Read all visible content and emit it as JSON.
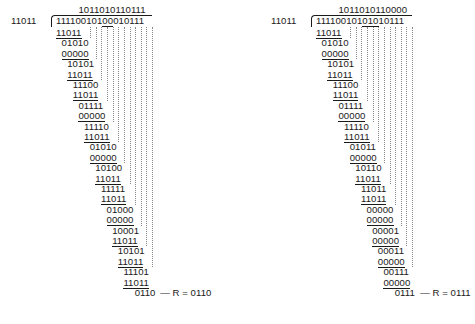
{
  "divisions": [
    {
      "divisor": "11011",
      "quotient": "1011010110111",
      "dividend": "11110010100010111",
      "dividend_underlined_index": [
        9,
        10
      ],
      "rows": [
        "11011",
        "01010",
        "00000",
        "10101",
        "11011",
        "11100",
        "11011",
        "01111",
        "00000",
        "11110",
        "11011",
        "01010",
        "00000",
        "10100",
        "11011",
        "11111",
        "11011",
        "01000",
        "00000",
        "10001",
        "11011",
        "10101",
        "11011",
        "11101",
        "11011"
      ],
      "remainder_row": "0110",
      "remainder_label": "— R = 0110"
    },
    {
      "divisor": "11011",
      "quotient": "1011010110000",
      "dividend": "11110010101010111",
      "dividend_underlined_index": [
        9,
        11
      ],
      "rows": [
        "11011",
        "01010",
        "00000",
        "10101",
        "11011",
        "11100",
        "11011",
        "01111",
        "00000",
        "11110",
        "11011",
        "01011",
        "00000",
        "10110",
        "11011",
        "11011",
        "11011",
        "00000",
        "00000",
        "00001",
        "00000",
        "00011",
        "00000",
        "00111",
        "00000"
      ],
      "remainder_row": "0111",
      "remainder_label": "— R = 0111"
    }
  ]
}
